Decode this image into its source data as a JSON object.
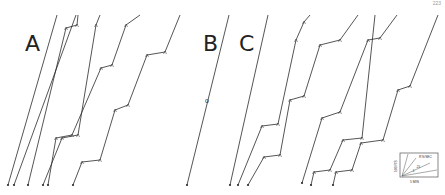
{
  "figure": {
    "page_number": "223",
    "panels": [
      {
        "id": "A",
        "label": "A"
      },
      {
        "id": "B",
        "label": "B"
      },
      {
        "id": "C",
        "label": "C"
      }
    ],
    "panel_b_marker": "o",
    "calibration": {
      "ylabel": "100 R'S",
      "xlabel": "5 MIN",
      "rate_label": "R'S/SEC",
      "rate_values": [
        "1",
        ".5",
        ".25",
        ".1"
      ]
    },
    "colors": {
      "ink": "#2a2a2a",
      "background": "#ffffff"
    }
  },
  "chart_data": {
    "type": "line",
    "xlabel": "Time (5 MIN calibration)",
    "ylabel": "Cumulative responses (100 R'S calibration)",
    "panels": [
      {
        "label": "A",
        "series": [
          {
            "name": "A1",
            "shape": "straight",
            "points": [
              [
                8,
                185
              ],
              [
                57,
                15
              ]
            ]
          },
          {
            "name": "A2",
            "shape": "straight",
            "points": [
              [
                14,
                185
              ],
              [
                76,
                15
              ]
            ]
          },
          {
            "name": "A3",
            "shape": "1 step",
            "points": [
              [
                28,
                185
              ],
              [
                66,
                28
              ],
              [
                77,
                25
              ],
              [
                78,
                15
              ]
            ]
          },
          {
            "name": "A4",
            "shape": "2 steps",
            "points": [
              [
                43,
                185
              ],
              [
                62,
                138
              ],
              [
                78,
                135
              ],
              [
                96,
                25
              ],
              [
                100,
                15
              ]
            ]
          },
          {
            "name": "A5",
            "shape": "3 steps",
            "points": [
              [
                48,
                185
              ],
              [
                56,
                138
              ],
              [
                72,
                135
              ],
              [
                101,
                68
              ],
              [
                112,
                65
              ],
              [
                126,
                25
              ],
              [
                140,
                15
              ]
            ]
          },
          {
            "name": "A6",
            "shape": "4 steps",
            "points": [
              [
                73,
                185
              ],
              [
                82,
                162
              ],
              [
                100,
                160
              ],
              [
                115,
                110
              ],
              [
                128,
                105
              ],
              [
                147,
                55
              ],
              [
                165,
                52
              ],
              [
                180,
                15
              ]
            ]
          }
        ]
      },
      {
        "label": "B",
        "series": [
          {
            "name": "B1",
            "shape": "straight",
            "points": [
              [
                187,
                185
              ],
              [
                229,
                15
              ]
            ]
          }
        ]
      },
      {
        "label": "C",
        "series": [
          {
            "name": "C1",
            "shape": "straight",
            "points": [
              [
                230,
                185
              ],
              [
                268,
                15
              ]
            ]
          },
          {
            "name": "C2",
            "shape": "2 steps",
            "points": [
              [
                238,
                185
              ],
              [
                262,
                126
              ],
              [
                278,
                124
              ],
              [
                296,
                40
              ],
              [
                304,
                22
              ],
              [
                310,
                15
              ]
            ]
          },
          {
            "name": "C3",
            "shape": "3 steps",
            "points": [
              [
                248,
                185
              ],
              [
                264,
                157
              ],
              [
                280,
                155
              ],
              [
                290,
                100
              ],
              [
                304,
                96
              ],
              [
                320,
                45
              ],
              [
                340,
                40
              ],
              [
                358,
                15
              ]
            ]
          },
          {
            "name": "C4",
            "shape": "3 steps",
            "points": [
              [
                302,
                183
              ],
              [
                322,
                118
              ],
              [
                340,
                112
              ],
              [
                368,
                40
              ],
              [
                380,
                38
              ],
              [
                397,
                15
              ]
            ]
          },
          {
            "name": "C5",
            "shape": "2 steps",
            "points": [
              [
                311,
                185
              ],
              [
                314,
                172
              ],
              [
                330,
                170
              ],
              [
                343,
                140
              ],
              [
                362,
                138
              ],
              [
                375,
                15
              ]
            ]
          },
          {
            "name": "C6",
            "shape": "3 steps",
            "points": [
              [
                333,
                185
              ],
              [
                336,
                172
              ],
              [
                352,
                170
              ],
              [
                361,
                143
              ],
              [
                383,
                140
              ],
              [
                398,
                90
              ],
              [
                410,
                86
              ],
              [
                438,
                15
              ]
            ]
          }
        ]
      }
    ],
    "legend": {
      "position": "bottom-right",
      "type": "calibration inset"
    },
    "grid": false
  }
}
